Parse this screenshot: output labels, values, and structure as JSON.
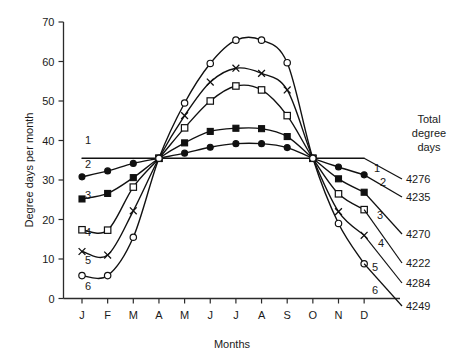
{
  "chart_data": {
    "type": "line",
    "title": "",
    "xlabel": "Months",
    "ylabel": "Degree days per month",
    "categories": [
      "J",
      "F",
      "M",
      "A",
      "M",
      "J",
      "J",
      "A",
      "S",
      "O",
      "N",
      "D"
    ],
    "xlim": [
      0,
      11
    ],
    "ylim": [
      0,
      70
    ],
    "yticks": [
      0,
      10,
      20,
      30,
      40,
      50,
      60,
      70
    ],
    "grid": false,
    "legend_position": "right-inline-labels",
    "annotations": {
      "totals_header_line1": "Total",
      "totals_header_line2": "degree",
      "totals_header_line3": "days"
    },
    "series": [
      {
        "name": "1",
        "label": "1",
        "marker": "none",
        "total_degree_days": "4276",
        "values": [
          35.5,
          35.5,
          35.5,
          35.5,
          35.5,
          35.5,
          35.5,
          35.5,
          35.5,
          35.5,
          35.5,
          35.5
        ]
      },
      {
        "name": "2",
        "label": "2",
        "marker": "filled-circle",
        "total_degree_days": "4235",
        "values": [
          30.8,
          32.3,
          34.2,
          35.5,
          36.8,
          38.3,
          39.2,
          39.2,
          38.2,
          35.5,
          33.3,
          31.3
        ]
      },
      {
        "name": "3",
        "label": "3",
        "marker": "filled-square",
        "total_degree_days": "4270",
        "values": [
          25.2,
          26.6,
          30.6,
          35.5,
          39.4,
          42.3,
          43.1,
          43.0,
          41.0,
          35.5,
          30.3,
          26.9
        ]
      },
      {
        "name": "4",
        "label": "4",
        "marker": "open-square",
        "total_degree_days": "4222",
        "values": [
          17.4,
          17.3,
          28.2,
          35.5,
          43.2,
          50.0,
          53.8,
          52.8,
          46.3,
          35.5,
          26.5,
          22.5
        ]
      },
      {
        "name": "5",
        "label": "5",
        "marker": "cross",
        "total_degree_days": "4284",
        "values": [
          11.9,
          11.0,
          22.2,
          35.5,
          46.3,
          54.8,
          58.3,
          57.0,
          52.8,
          35.5,
          22.0,
          16.0
        ]
      },
      {
        "name": "6",
        "label": "6",
        "marker": "open-circle",
        "total_degree_days": "4249",
        "values": [
          5.8,
          5.8,
          15.5,
          35.5,
          49.5,
          59.5,
          65.4,
          65.4,
          59.7,
          35.5,
          19.0,
          8.8
        ]
      }
    ]
  },
  "axes": {
    "y_tick_labels": [
      "0",
      "10",
      "20",
      "30",
      "40",
      "50",
      "60",
      "70"
    ],
    "x_tick_labels": [
      "J",
      "F",
      "M",
      "A",
      "M",
      "J",
      "J",
      "A",
      "S",
      "O",
      "N",
      "D"
    ],
    "y_axis_title": "Degree days per month",
    "x_axis_title": "Months"
  },
  "totals_panel": {
    "header": [
      "Total",
      "degree",
      "days"
    ],
    "rows": [
      {
        "curve": "1",
        "value": "4276"
      },
      {
        "curve": "2",
        "value": "4235"
      },
      {
        "curve": "3",
        "value": "4270"
      },
      {
        "curve": "4",
        "value": "4222"
      },
      {
        "curve": "5",
        "value": "4284"
      },
      {
        "curve": "6",
        "value": "4249"
      }
    ]
  }
}
